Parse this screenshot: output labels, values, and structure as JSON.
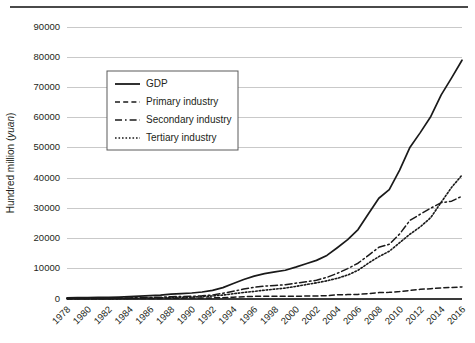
{
  "figure": {
    "rule_present": true
  },
  "chart_data": {
    "type": "line",
    "title": "",
    "xlabel": "",
    "ylabel": "Hundred million (yuan)",
    "ylabel_plain": "Hundred million (",
    "ylabel_italic": "yuan",
    "ylabel_tail": ")",
    "grid": true,
    "legend_position": "upper-left-inside",
    "ylim": [
      0,
      90000
    ],
    "ytick_labels": [
      "0",
      "10000",
      "20000",
      "30000",
      "40000",
      "50000",
      "60000",
      "70000",
      "80000",
      "90000"
    ],
    "ytick_values": [
      0,
      10000,
      20000,
      30000,
      40000,
      50000,
      60000,
      70000,
      80000,
      90000
    ],
    "xtick_labels": [
      "1978",
      "1980",
      "1982",
      "1984",
      "1986",
      "1988",
      "1990",
      "1992",
      "1994",
      "1996",
      "1998",
      "2000",
      "2002",
      "2004",
      "2006",
      "2008",
      "2010",
      "2012",
      "2014",
      "2016"
    ],
    "x": [
      1978,
      1979,
      1980,
      1981,
      1982,
      1983,
      1984,
      1985,
      1986,
      1987,
      1988,
      1989,
      1990,
      1991,
      1992,
      1993,
      1994,
      1995,
      1996,
      1997,
      1998,
      1999,
      2000,
      2001,
      2002,
      2003,
      2004,
      2005,
      2006,
      2007,
      2008,
      2009,
      2010,
      2011,
      2012,
      2013,
      2014,
      2015,
      2016
    ],
    "xlim": [
      1978,
      2016
    ],
    "series": [
      {
        "name": "GDP",
        "style": "solid",
        "values": [
          3650,
          4100,
          4550,
          4890,
          5320,
          5960,
          7210,
          9020,
          10280,
          12060,
          15040,
          17000,
          18720,
          21830,
          26920,
          35530,
          48200,
          60790,
          71180,
          78970,
          84400,
          89680,
          99210,
          109660,
          120330,
          135820,
          159880,
          184940,
          216310,
          265810,
          314040,
          340900,
          401500,
          473100,
          519300,
          568800,
          636100,
          689100,
          744100
        ],
        "values_display_end": 79000
      },
      {
        "name": "Primary industry",
        "style": "dashed",
        "values": [
          1020,
          1270,
          1370,
          1560,
          1780,
          1980,
          2320,
          2560,
          2790,
          3230,
          3860,
          4270,
          5020,
          5290,
          5800,
          6900,
          9460,
          12020,
          14020,
          14440,
          14820,
          14770,
          14710,
          15500,
          16190,
          16970,
          21800,
          23070,
          24040,
          28630,
          33700,
          35200,
          39400,
          45150,
          50900,
          54300,
          58300,
          60800,
          63700
        ],
        "values_display_end": 4000
      },
      {
        "name": "Secondary industry",
        "style": "dash-dot",
        "values": [
          1750,
          1920,
          2190,
          2260,
          2380,
          2650,
          3110,
          3870,
          4490,
          5250,
          6590,
          7280,
          7720,
          9100,
          11700,
          16430,
          22370,
          28540,
          33610,
          37220,
          39000,
          41030,
          45560,
          49510,
          53900,
          62440,
          73900,
          87600,
          103160,
          125800,
          149000,
          157600,
          187400,
          227000,
          244600,
          261900,
          277600,
          282000,
          296200
        ],
        "values_display_end": 34000
      },
      {
        "name": "Tertiary industry",
        "style": "dotted",
        "values": [
          880,
          910,
          990,
          1070,
          1160,
          1330,
          1770,
          2590,
          3000,
          3580,
          4590,
          5450,
          5980,
          7440,
          9420,
          12200,
          16370,
          20230,
          23550,
          27310,
          30580,
          33870,
          38940,
          44650,
          50240,
          56410,
          64180,
          74270,
          89110,
          111350,
          131340,
          148100,
          174700,
          201000,
          224000,
          252700,
          300000,
          346200,
          384200
        ],
        "values_display_end": 41000
      }
    ],
    "legend_entries": [
      {
        "label": "GDP",
        "style": "solid"
      },
      {
        "label": "Primary industry",
        "style": "dashed"
      },
      {
        "label": "Secondary industry",
        "style": "dash-dot"
      },
      {
        "label": "Tertiary industry",
        "style": "dotted"
      }
    ]
  }
}
